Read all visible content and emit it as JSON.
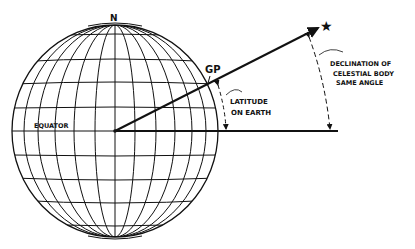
{
  "diagram": {
    "labels": {
      "north": "N",
      "gp": "GP",
      "equator": "EQUATOR",
      "latitude_line1": "LATITUDE",
      "latitude_line2": "ON EARTH",
      "declination_line1": "DECLINATION OF",
      "declination_line2": "CELESTIAL BODY",
      "declination_line3": "SAME ANGLE"
    },
    "symbols": {
      "star": "★"
    },
    "colors": {
      "ink": "#111111",
      "background": "#ffffff"
    }
  }
}
